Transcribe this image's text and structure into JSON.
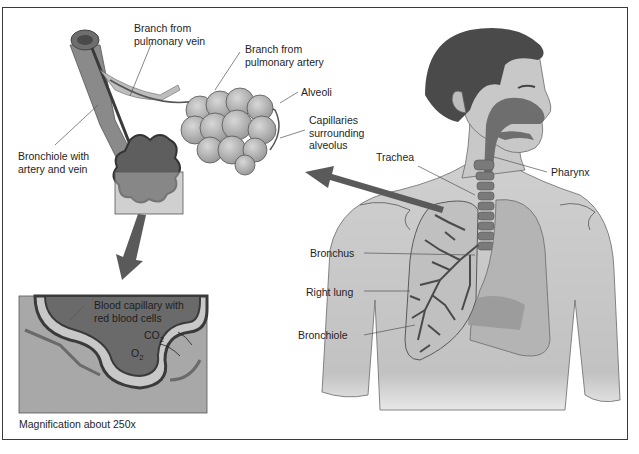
{
  "figure": {
    "type": "anatomy-diagram",
    "colors": {
      "frame": "#3a3a3a",
      "skin": "#c6c6c6",
      "hair": "#4a4a4a",
      "airway": "#6e6e6e",
      "lung": "#b0b0b0",
      "arrow": "#5a5a5a",
      "leader": "#555555",
      "text": "#1e1e1e"
    }
  },
  "labels": {
    "branch_vein": "Branch from\npulmonary vein",
    "branch_artery": "Branch from\npulmonary artery",
    "alveoli": "Alveoli",
    "capillaries": "Capillaries\nsurrounding\nalveolus",
    "bronchiole_with": "Bronchiole with\nartery and vein",
    "trachea": "Trachea",
    "pharynx": "Pharynx",
    "bronchus": "Bronchus",
    "right_lung": "Right lung",
    "bronchiole": "Bronchiole",
    "blood_capillary": "Blood capillary with\nred blood cells",
    "co2_main": "CO",
    "co2_sub": "2",
    "o2_main": "O",
    "o2_sub": "2",
    "magnification": "Magnification about 250x"
  }
}
